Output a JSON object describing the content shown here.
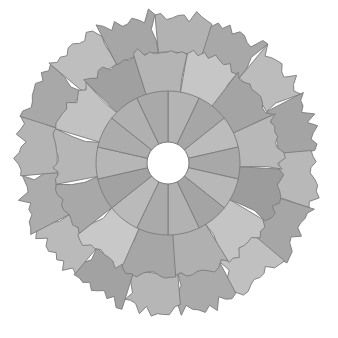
{
  "figure": {
    "type": "radial-mosaic",
    "background": "#ffffff",
    "border_color": "#7a7a7a",
    "center": {
      "x": 168,
      "y": 163
    },
    "hole_radius": 21,
    "rings": [
      {
        "name": "inner-ring",
        "r_in": 21,
        "r_out": 72,
        "jag": 0.0,
        "rotation_deg": -90,
        "shades": [
          "#b4b4b4",
          "#a6a6a6",
          "#bcbcbc",
          "#a8a8a8",
          "#b8b8b8",
          "#a4a4a4",
          "#b2b2b2",
          "#aaaaaa",
          "#bababa",
          "#a2a2a2",
          "#b6b6b6",
          "#acacac",
          "#b0b0b0",
          "#a9a9a9"
        ]
      },
      {
        "name": "middle-ring",
        "r_in": 72,
        "r_out": 112,
        "jag": 5,
        "rotation_deg": -80,
        "shades": [
          "#c6c6c6",
          "#a4a4a4",
          "#b8b8b8",
          "#9c9c9c",
          "#c4c4c4",
          "#b0b0b0",
          "#a6a6a6",
          "#c8c8c8",
          "#a8a8a8",
          "#b6b6b6",
          "#c2c2c2",
          "#a0a0a0",
          "#b4b4b4"
        ]
      },
      {
        "name": "outer-ring",
        "r_in": 112,
        "r_out": 146,
        "jag": 7,
        "rotation_deg": -95,
        "shades": [
          "#b2b2b2",
          "#a8a8a8",
          "#bcbcbc",
          "#a4a4a4",
          "#b8b8b8",
          "#a6a6a6",
          "#c0c0c0",
          "#aaaaaa",
          "#b6b6b6",
          "#a2a2a2",
          "#bababa",
          "#acacac",
          "#b4b4b4",
          "#a8a8a8",
          "#bebebe",
          "#a6a6a6"
        ]
      }
    ]
  }
}
